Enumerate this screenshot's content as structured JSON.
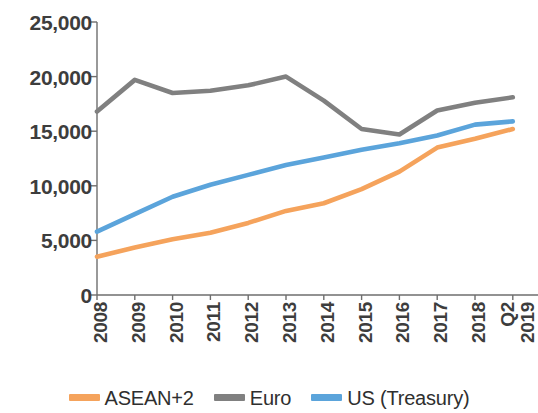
{
  "chart_data": {
    "type": "line",
    "title": "",
    "subtitle": "",
    "xlabel": "",
    "ylabel": "",
    "ylim": [
      0,
      25000
    ],
    "grid": false,
    "legend_position": "bottom",
    "categories": [
      "2008",
      "2009",
      "2010",
      "2011",
      "2012",
      "2013",
      "2014",
      "2015",
      "2016",
      "2017",
      "2018",
      "Q2 2019"
    ],
    "series": [
      {
        "name": "ASEAN+2",
        "color": "#F5A35C",
        "values": [
          3500,
          4350,
          5100,
          5700,
          6600,
          7700,
          8400,
          9700,
          11300,
          13500,
          14300,
          15200
        ]
      },
      {
        "name": "Euro",
        "color": "#808080",
        "values": [
          16800,
          19700,
          18500,
          18700,
          19200,
          20000,
          17800,
          15200,
          14700,
          16900,
          17600,
          18100
        ]
      },
      {
        "name": "US (Treasury)",
        "color": "#5BA4DB",
        "values": [
          5800,
          7400,
          9000,
          10100,
          11000,
          11900,
          12600,
          13300,
          13900,
          14600,
          15600,
          15900
        ]
      }
    ],
    "y_ticks": [
      {
        "value": 25000,
        "label": "25,000"
      },
      {
        "value": 20000,
        "label": "20,000"
      },
      {
        "value": 15000,
        "label": "15,000"
      },
      {
        "value": 10000,
        "label": "10,000"
      },
      {
        "value": 5000,
        "label": "5,000"
      },
      {
        "value": 0,
        "label": "0"
      }
    ],
    "x_ticks": [
      {
        "label": "2008",
        "sub": ""
      },
      {
        "label": "2009",
        "sub": ""
      },
      {
        "label": "2010",
        "sub": ""
      },
      {
        "label": "2011",
        "sub": ""
      },
      {
        "label": "2012",
        "sub": ""
      },
      {
        "label": "2013",
        "sub": ""
      },
      {
        "label": "2014",
        "sub": ""
      },
      {
        "label": "2015",
        "sub": ""
      },
      {
        "label": "2016",
        "sub": ""
      },
      {
        "label": "2017",
        "sub": ""
      },
      {
        "label": "2018",
        "sub": ""
      },
      {
        "label": "2019",
        "sub": "Q2"
      }
    ]
  },
  "legend": {
    "items": [
      {
        "label": "ASEAN+2",
        "color": "#F5A35C"
      },
      {
        "label": "Euro",
        "color": "#808080"
      },
      {
        "label": "US (Treasury)",
        "color": "#5BA4DB"
      }
    ]
  },
  "axis": {
    "line_color": "#6e6e6e"
  }
}
